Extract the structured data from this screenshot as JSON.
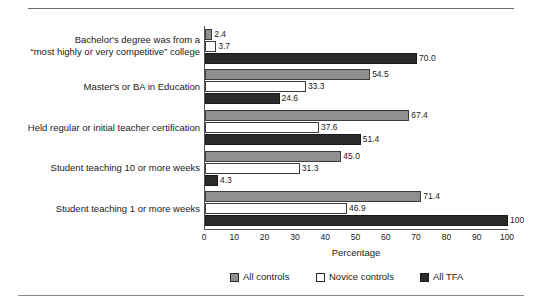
{
  "chart_data": {
    "type": "bar",
    "orientation": "horizontal",
    "title": "",
    "xlabel": "Percentage",
    "ylabel": "",
    "xlim": [
      0,
      100
    ],
    "xticks": [
      0,
      10,
      20,
      30,
      40,
      50,
      60,
      70,
      80,
      90,
      100
    ],
    "xtick_labels": [
      "0",
      "10",
      "20",
      "30",
      "40",
      "50",
      "60",
      "70",
      "80",
      "90",
      "100"
    ],
    "grid": false,
    "legend_position": "bottom",
    "categories": [
      "Bachelor's degree was from a\n“most highly or very competitive” college",
      "Master's or BA in Education",
      "Held regular or initial teacher certification",
      "Student teaching 10 or more weeks",
      "Student teaching 1 or more weeks"
    ],
    "series": [
      {
        "name": "All controls",
        "color": "#8f8f8f",
        "values": [
          2.4,
          54.5,
          67.4,
          45.0,
          71.4
        ],
        "value_labels": [
          "2.4",
          "54.5",
          "67.4",
          "45.0",
          "71.4"
        ]
      },
      {
        "name": "Novice controls",
        "color": "#ffffff",
        "values": [
          3.7,
          33.3,
          37.6,
          31.3,
          46.9
        ],
        "value_labels": [
          "3.7",
          "33.3",
          "37.6",
          "31.3",
          "46.9"
        ]
      },
      {
        "name": "All TFA",
        "color": "#2b2b2b",
        "values": [
          70.0,
          24.6,
          51.4,
          4.3,
          100
        ],
        "value_labels": [
          "70.0",
          "24.6",
          "51.4",
          "4.3",
          "100"
        ]
      }
    ]
  },
  "legend": {
    "items": [
      {
        "label": "All controls",
        "swatch": "all-controls"
      },
      {
        "label": "Novice controls",
        "swatch": "novice-controls"
      },
      {
        "label": "All TFA",
        "swatch": "all-tfa"
      }
    ]
  }
}
